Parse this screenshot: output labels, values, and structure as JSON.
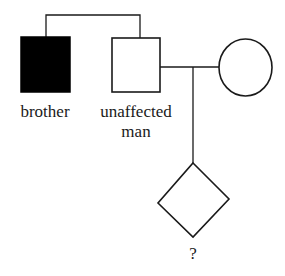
{
  "diagram": {
    "type": "pedigree",
    "colors": {
      "line": "#1a1a1a",
      "affected_fill": "#000000",
      "unaffected_fill": "#ffffff",
      "background": "#ffffff"
    },
    "individuals": [
      {
        "id": "brother",
        "label": "brother",
        "shape": "square",
        "sex": "male",
        "affected": true
      },
      {
        "id": "unaffected-man",
        "label_line1": "unaffected",
        "label_line2": "man",
        "shape": "square",
        "sex": "male",
        "affected": false
      },
      {
        "id": "partner",
        "label": "",
        "shape": "circle",
        "sex": "female",
        "affected": false
      },
      {
        "id": "child",
        "label": "?",
        "shape": "diamond",
        "sex": "unknown",
        "affected": null
      }
    ],
    "relationships": [
      {
        "type": "sibling",
        "members": [
          "brother",
          "unaffected-man"
        ]
      },
      {
        "type": "mating",
        "members": [
          "unaffected-man",
          "partner"
        ]
      },
      {
        "type": "offspring",
        "parents": [
          "unaffected-man",
          "partner"
        ],
        "child": "child"
      }
    ]
  },
  "labels": {
    "brother": "brother",
    "unaffected_line1": "unaffected",
    "unaffected_line2": "man",
    "child": "?"
  }
}
